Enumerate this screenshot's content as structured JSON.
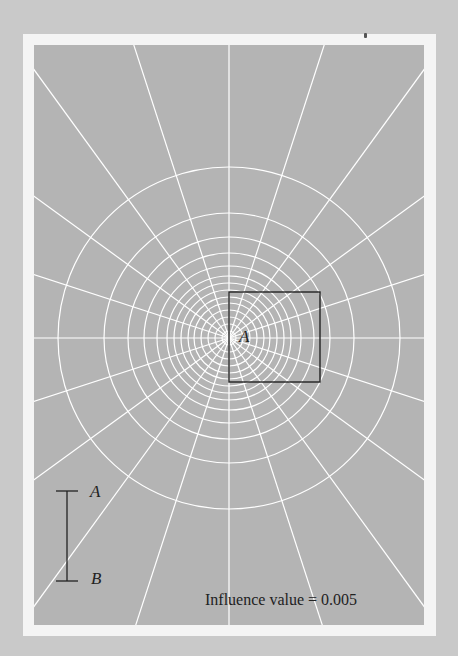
{
  "figure": {
    "point_label": "A",
    "scale_bar": {
      "top_label": "A",
      "bottom_label": "B"
    },
    "caption": "Influence value = 0.005"
  },
  "geometry": {
    "center": {
      "x": 195,
      "y": 293
    },
    "circle_radii": [
      7,
      14,
      21,
      28,
      35,
      41,
      48,
      55,
      62,
      72,
      85,
      101,
      125,
      171
    ],
    "radial_line_count": 20,
    "radial_angle_step_deg": 18,
    "square_box": {
      "x": 195,
      "y": 247,
      "width": 91,
      "height": 90
    }
  },
  "colors": {
    "page_background": "#c9c9c9",
    "frame": "#f4f4f4",
    "panel": "#b4b4b4",
    "grid_lines": "#ffffff",
    "ink": "#222222"
  }
}
